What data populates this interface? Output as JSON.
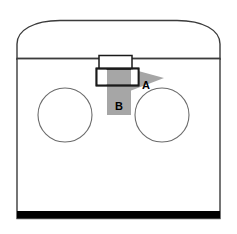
{
  "diagram": {
    "background_color": "#ffffff",
    "outline_color": "#3b3b3b",
    "fill_color": "#ffffff",
    "band_color": "#a6a6a6",
    "arrow_color": "#a6a6a6",
    "base_bar_color": "#000000",
    "labels": [
      {
        "id": "A",
        "text": "A",
        "role": "arrow-callout",
        "x": 146,
        "y": 85
      },
      {
        "id": "B",
        "text": "B",
        "role": "band-callout",
        "x": 118,
        "y": 108
      }
    ],
    "parts": {
      "body": {
        "name": "cabinet-body",
        "left": 17,
        "right": 220,
        "top": 58,
        "bottom": 219
      },
      "dome": {
        "name": "arched-top",
        "apex_y": 20,
        "shoulder_y": 58
      },
      "left_circle": {
        "name": "left-burner",
        "cx": 65,
        "cy": 115,
        "r": 27
      },
      "right_circle": {
        "name": "right-burner",
        "cx": 162,
        "cy": 115,
        "r": 27
      },
      "upper_box": {
        "name": "upper-vent-box",
        "x": 98,
        "y": 55,
        "w": 33,
        "h": 14
      },
      "lower_box": {
        "name": "lower-vent-box",
        "x": 96,
        "y": 68,
        "w": 42,
        "h": 17
      },
      "band": {
        "name": "vertical-gray-band",
        "x": 107,
        "y": 67,
        "w": 24,
        "h": 48
      },
      "arrow": {
        "name": "arrow-a",
        "direction": "right",
        "tail_x": 128,
        "tip_x": 165,
        "y": 78
      },
      "base_bar": {
        "name": "base-bar",
        "x": 17,
        "y": 212,
        "w": 203,
        "h": 7
      }
    }
  }
}
